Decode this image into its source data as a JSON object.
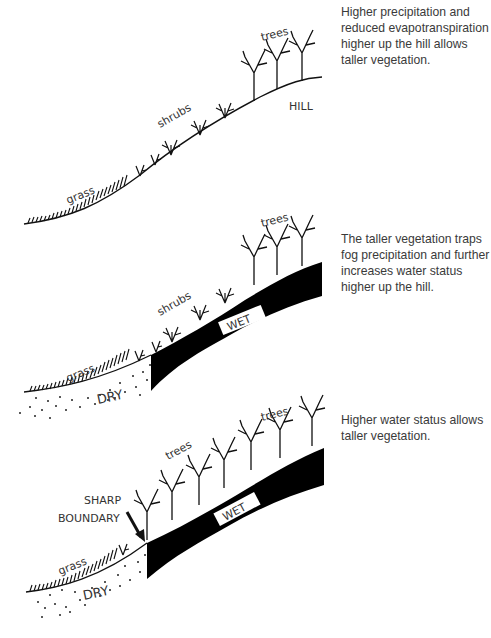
{
  "panels": [
    {
      "id": "panel-1",
      "labels": {
        "grass": "grass",
        "shrubs": "shrubs",
        "trees": "trees",
        "hill": "HILL"
      },
      "description": "Higher precipitation and reduced evapotranspiration higher up the hill allows taller vegetation."
    },
    {
      "id": "panel-2",
      "labels": {
        "grass": "grass",
        "shrubs": "shrubs",
        "trees": "trees",
        "dry": "DRY",
        "wet": "WET"
      },
      "description": "The taller vegetation traps fog precipitation and further increases water status higher up the hill."
    },
    {
      "id": "panel-3",
      "labels": {
        "grass": "grass",
        "trees_low": "trees",
        "trees_high": "trees",
        "dry": "DRY",
        "wet": "WET",
        "boundary_line1": "SHARP",
        "boundary_line2": "BOUNDARY"
      },
      "description": "Higher water status allows taller vegetation."
    }
  ],
  "colors": {
    "ink": "#111111",
    "text": "#3a3a3a",
    "wet_fill": "#000000"
  }
}
